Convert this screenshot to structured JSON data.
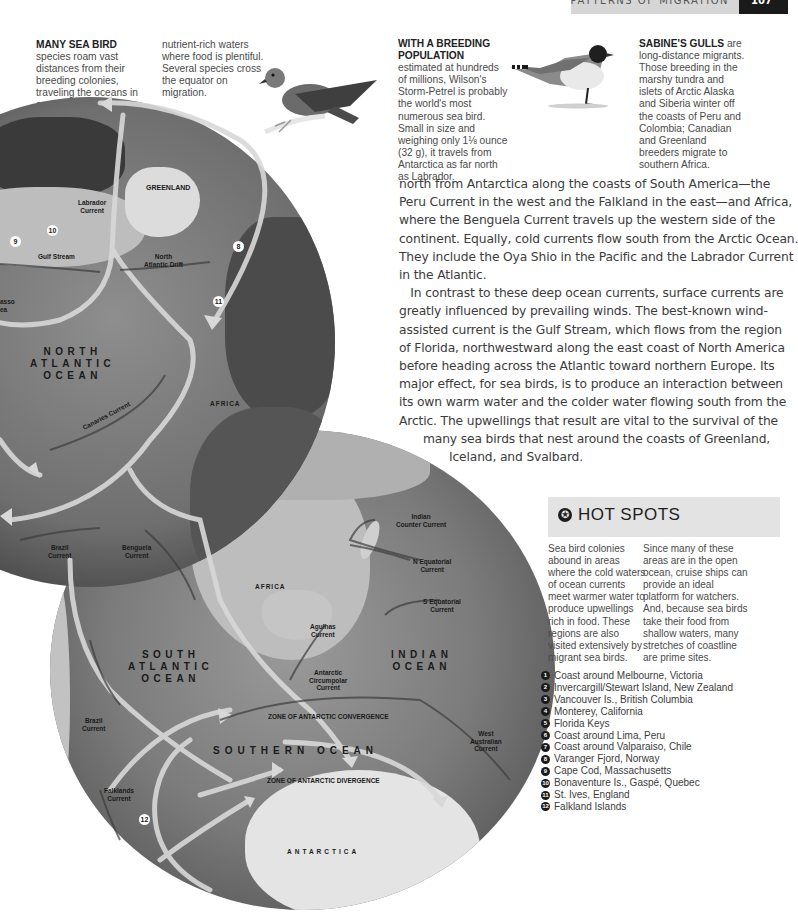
{
  "header": {
    "running_title": "PATTERNS OF MIGRATION",
    "page_number": "107"
  },
  "intro_caption": {
    "lead": "MANY SEA BIRD",
    "col1_rest": "species roam vast distances from their breeding colonies, traveling the oceans in search of",
    "col2": "nutrient-rich waters where food is plentiful. Several species cross the equator on migration."
  },
  "captions": {
    "storm_petrel": {
      "lead": "WITH A BREEDING POPULATION",
      "text": "estimated at hundreds of millions, Wilson's Storm-Petrel is probably the world's most numerous sea bird. Small in size and weighing only 1⅛ ounce (32 g), it travels from Antarctica as far north as Labrador."
    },
    "sabines_gull": {
      "lead": "SABINE'S GULLS",
      "text": "are long-distance migrants. Those breeding in the marshy tundra and islets of Arctic Alaska and Siberia winter off the coasts of Peru and Colombia; Canadian and Greenland breeders migrate to southern Africa."
    }
  },
  "body_text": {
    "lines": [
      "north from Antarctica along the coasts of South America—the",
      "Peru Current in the west and the Falkland in the east—and Africa,",
      "where the Benguela Current travels up the western side of the",
      "continent. Equally, cold currents flow south from the Arctic Ocean.",
      "They include the Oya Shio in the Pacific and the Labrador Current",
      "in the Atlantic.",
      "   In contrast to these deep ocean currents, surface currents are",
      "greatly influenced by prevailing winds. The best-known wind-",
      "assisted current is the Gulf Stream, which flows from the region",
      "of Florida, northwestward along the east coast of North America",
      "before heading across the Atlantic toward northern Europe. Its",
      "major effect, for sea birds, is to produce an interaction between",
      "its own warm water and the colder water flowing south from the",
      "Arctic. The upwellings that result are vital to the survival of the",
      "many sea birds that nest around the coasts of Greenland,",
      "Iceland, and Svalbard."
    ]
  },
  "map": {
    "north_globe": {
      "labels": {
        "greenland": "GREENLAND",
        "labrador_current": "Labrador\nCurrent",
        "gulf_stream": "Gulf Stream",
        "north_atlantic_drift": "North\nAtlantic Drift",
        "north_atlantic_ocean": "NORTH\nATLANTIC\nOCEAN",
        "canaries_current": "Canaries Current",
        "africa": "AFRICA",
        "sargasso_partial": "asso\nea"
      },
      "markers": [
        "9",
        "10",
        "8",
        "11"
      ]
    },
    "south_globe": {
      "labels": {
        "brazil_current_top": "Brazil\nCurrent",
        "benguela_current": "Benguela\nCurrent",
        "africa": "AFRICA",
        "indian_counter_current": "Indian\nCounter Current",
        "n_equatorial_current": "N Equatorial\nCurrent",
        "s_equatorial_current": "S Equatorial\nCurrent",
        "agulhas_current": "Agulhas\nCurrent",
        "south_atlantic_ocean": "SOUTH\nATLANTIC\nOCEAN",
        "indian_ocean": "INDIAN\nOCEAN",
        "antarctic_circumpolar_current": "Antarctic\nCircumpolar\nCurrent",
        "zone_convergence": "ZONE OF ANTARCTIC CONVERGENCE",
        "southern_ocean": "SOUTHERN OCEAN",
        "zone_divergence": "ZONE OF ANTARCTIC DIVERGENCE",
        "brazil_current_left": "Brazil\nCurrent",
        "west_australian_current": "West\nAustralian\nCurrent",
        "falklands_current": "Falklands\nCurrent",
        "antarctica": "ANTARCTICA"
      },
      "markers": [
        "12"
      ]
    }
  },
  "hot_spots": {
    "title": "HOT SPOTS",
    "col1": "Sea bird colonies abound in areas where the cold waters of ocean currents meet warmer water to produce upwellings rich in food. These regions are also visited extensively by migrant sea birds.",
    "col2": "Since many of these areas are in the open ocean, cruise ships can provide an ideal platform for watchers. And, because sea birds take their food from shallow waters, many stretches of coastline are prime sites.",
    "sites": [
      {
        "n": "1",
        "name": "Coast around Melbourne, Victoria"
      },
      {
        "n": "2",
        "name": "Invercargill/Stewart Island, New Zealand"
      },
      {
        "n": "3",
        "name": "Vancouver Is., British Columbia"
      },
      {
        "n": "4",
        "name": "Monterey, California"
      },
      {
        "n": "5",
        "name": "Florida Keys"
      },
      {
        "n": "6",
        "name": "Coast around Lima, Peru"
      },
      {
        "n": "7",
        "name": "Coast around Valparaiso, Chile"
      },
      {
        "n": "8",
        "name": "Varanger Fjord, Norway"
      },
      {
        "n": "9",
        "name": "Cape Cod, Massachusetts"
      },
      {
        "n": "10",
        "name": "Bonaventure Is., Gaspé, Quebec"
      },
      {
        "n": "11",
        "name": "St. Ives, England"
      },
      {
        "n": "12",
        "name": "Falkland Islands"
      }
    ]
  }
}
